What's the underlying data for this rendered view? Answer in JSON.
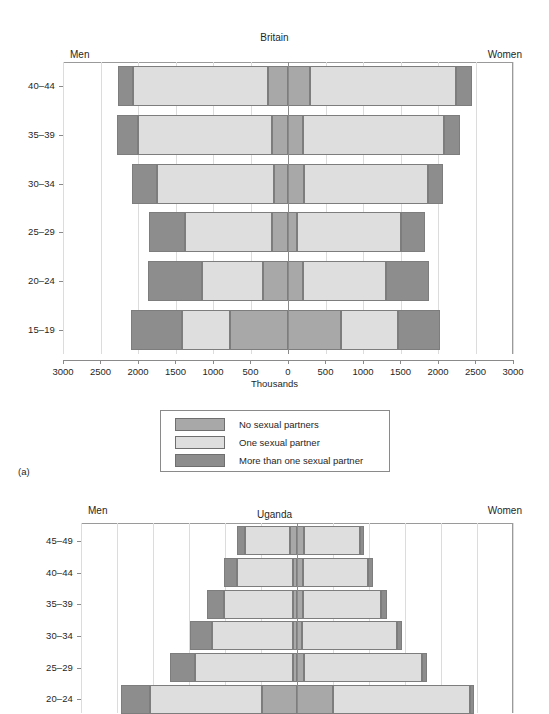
{
  "figure": {
    "letter_a": "(a)",
    "male_side_label": "Men",
    "female_side_label": "Women"
  },
  "legend": {
    "items": [
      {
        "label": "No sexual partners",
        "color": "#a8a8a8",
        "key": "none"
      },
      {
        "label": "One sexual partner",
        "color": "#dedede",
        "key": "one"
      },
      {
        "label": "More than one sexual partner",
        "color": "#8d8d8d",
        "key": "more"
      }
    ]
  },
  "chart_data": [
    {
      "type": "bar",
      "subtype": "population-pyramid-stacked",
      "title": "Britain",
      "xlabel": "Thousands",
      "ylabel": "",
      "left_label": "Men",
      "right_label": "Women",
      "grid": true,
      "legend_position": "below",
      "xlim": [
        -3000,
        3000
      ],
      "xticks": [
        3000,
        2500,
        2000,
        1500,
        1000,
        500,
        0,
        500,
        1000,
        1500,
        2000,
        2500,
        3000
      ],
      "xtick_values": [
        -3000,
        -2500,
        -2000,
        -1500,
        -1000,
        -500,
        0,
        500,
        1000,
        1500,
        2000,
        2500,
        3000
      ],
      "categories": [
        "40–44",
        "35–39",
        "30–34",
        "25–29",
        "20–24",
        "15–19"
      ],
      "series": [
        {
          "name": "No sexual partners",
          "key": "none",
          "men": [
            270,
            220,
            190,
            210,
            340,
            780
          ],
          "women": [
            290,
            200,
            210,
            120,
            200,
            700
          ]
        },
        {
          "name": "One sexual partner",
          "key": "one",
          "men": [
            1800,
            1780,
            1560,
            1160,
            810,
            640
          ],
          "women": [
            1950,
            1880,
            1660,
            1380,
            1100,
            760
          ]
        },
        {
          "name": "More than one sexual partner",
          "key": "more",
          "men": [
            200,
            280,
            330,
            490,
            720,
            680
          ],
          "women": [
            210,
            210,
            190,
            320,
            580,
            570
          ]
        }
      ]
    },
    {
      "type": "bar",
      "subtype": "population-pyramid-stacked",
      "title": "Uganda",
      "xlabel": "",
      "ylabel": "",
      "left_label": "Men",
      "right_label": "Women",
      "grid": true,
      "xlim": [
        -3000,
        3000
      ],
      "categories": [
        "45–49",
        "40–44",
        "35–39",
        "30–34",
        "25–29",
        "20–24"
      ],
      "series": [
        {
          "name": "No sexual partners",
          "key": "none",
          "men": [
            100,
            60,
            60,
            50,
            60,
            480
          ],
          "women": [
            95,
            90,
            85,
            70,
            100,
            500
          ]
        },
        {
          "name": "One sexual partner",
          "key": "one",
          "men": [
            620,
            780,
            960,
            1130,
            1350,
            1560
          ],
          "women": [
            780,
            900,
            1080,
            1320,
            1640,
            1900
          ]
        },
        {
          "name": "More than one sexual partner",
          "key": "more",
          "men": [
            110,
            180,
            230,
            300,
            360,
            400
          ],
          "women": [
            60,
            70,
            80,
            70,
            60,
            60
          ]
        }
      ]
    }
  ]
}
